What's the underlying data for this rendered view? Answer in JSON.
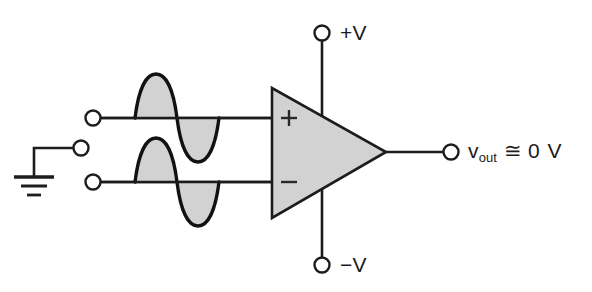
{
  "diagram": {
    "type": "schematic",
    "background_color": "#ffffff",
    "line_color": "#1c1c1c",
    "fill_color": "#d2d2d2"
  },
  "opamp": {
    "name": "operational-amplifier",
    "noninverting_input_label": "+",
    "inverting_input_label": "−",
    "body_fill": "#d2d2d2",
    "outline": "#1c1c1c"
  },
  "rails": {
    "positive_label": "+V",
    "negative_label": "−V"
  },
  "output": {
    "variable": "v",
    "subscript": "out",
    "relation": "≅",
    "value": "0 V",
    "full_label": "v_out ≅ 0 V"
  },
  "inputs": {
    "terminals": [
      {
        "name": "noninverting-input-terminal",
        "label": ""
      },
      {
        "name": "ground-terminal",
        "label": ""
      },
      {
        "name": "inverting-input-terminal",
        "label": ""
      }
    ],
    "ground_symbol": "earth-ground",
    "waveforms": [
      {
        "name": "upper-input-waveform",
        "shape": "sine",
        "cycles": 1,
        "phase": "in-phase",
        "shaded": true
      },
      {
        "name": "lower-input-waveform",
        "shape": "sine",
        "cycles": 1,
        "phase": "in-phase",
        "shaded": true
      }
    ]
  }
}
